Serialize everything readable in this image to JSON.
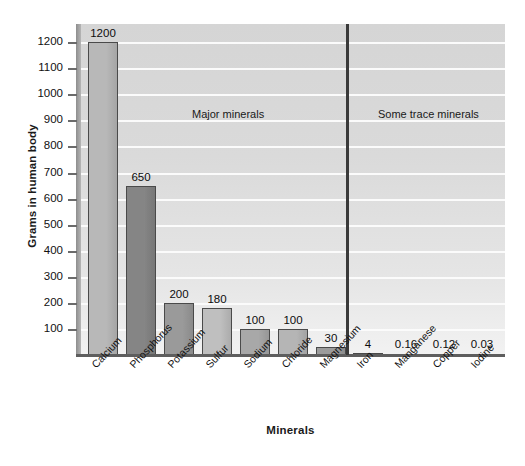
{
  "chart_data": {
    "type": "bar",
    "title": "",
    "xlabel": "Minerals",
    "ylabel": "Grams in human body",
    "ylim": [
      0,
      1270
    ],
    "grid": true,
    "legend": "none",
    "categories": [
      "Calcium",
      "Phosphorus",
      "Potassium",
      "Sulfur",
      "Sodium",
      "Chloride",
      "Magnesium",
      "Iron",
      "Manganese",
      "Copper",
      "Iodine"
    ],
    "values": [
      1200,
      650,
      200,
      180,
      100,
      100,
      30,
      4,
      0.16,
      0.12,
      0.03
    ],
    "value_labels": [
      "1200",
      "650",
      "200",
      "180",
      "100",
      "100",
      "30",
      "4",
      "0.16",
      "0.12",
      "0.03"
    ],
    "bar_colors": [
      "#b8b8b8",
      "#858585",
      "#9a9a9a",
      "#bfbfbf",
      "#a8a8a8",
      "#b5b5b5",
      "#9c9c9c",
      "#9e9e9e",
      "#9e9e9e",
      "#9e9e9e",
      "#9e9e9e"
    ],
    "y_ticks": [
      100,
      200,
      300,
      400,
      500,
      600,
      700,
      800,
      900,
      1000,
      1100,
      1200
    ],
    "y_tick_labels": [
      "100",
      "200",
      "300",
      "400",
      "500",
      "600",
      "700",
      "800",
      "900",
      "1000",
      "1100",
      "1200"
    ],
    "annotations": [
      {
        "name": "major-minerals",
        "text": "Major minerals"
      },
      {
        "name": "trace-minerals",
        "text": "Some trace minerals"
      }
    ],
    "divider_after_category": "Magnesium",
    "plot_background": "#dcdcdc",
    "gridline_color": "#fbfbfb",
    "axis_color": "#5e5e5e"
  }
}
